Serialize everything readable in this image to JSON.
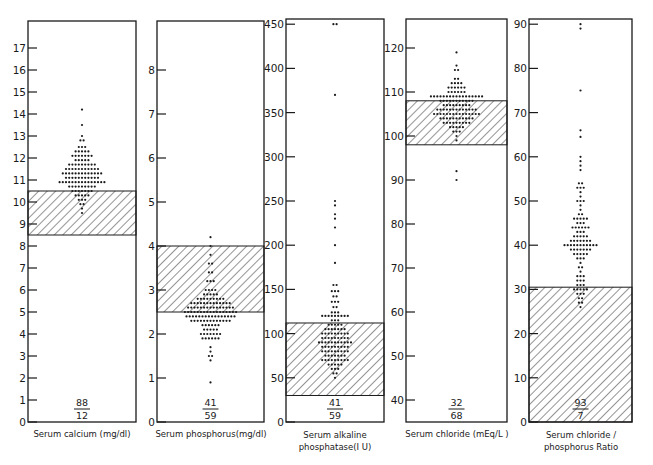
{
  "chart_data": [
    {
      "type": "scatter",
      "subtype": "dot-strip with shaded normal range",
      "title": "",
      "xlabel": "Serum calcium (mg/dl)",
      "ylabel": "",
      "ylim": [
        0,
        18
      ],
      "yticks": [
        0,
        1,
        2,
        3,
        4,
        5,
        6,
        7,
        8,
        9,
        10,
        11,
        12,
        13,
        14,
        15,
        16,
        17
      ],
      "normal_range": [
        8.5,
        10.5
      ],
      "fraction": {
        "numerator": "88",
        "denominator": "12"
      },
      "distribution": [
        {
          "y": 14.2,
          "n": 1
        },
        {
          "y": 13.5,
          "n": 1
        },
        {
          "y": 13.0,
          "n": 1
        },
        {
          "y": 12.8,
          "n": 2
        },
        {
          "y": 12.5,
          "n": 3
        },
        {
          "y": 12.3,
          "n": 5
        },
        {
          "y": 12.1,
          "n": 7
        },
        {
          "y": 11.9,
          "n": 5
        },
        {
          "y": 11.7,
          "n": 9
        },
        {
          "y": 11.5,
          "n": 11
        },
        {
          "y": 11.3,
          "n": 13
        },
        {
          "y": 11.1,
          "n": 11
        },
        {
          "y": 10.9,
          "n": 15
        },
        {
          "y": 10.7,
          "n": 9
        },
        {
          "y": 10.5,
          "n": 7
        },
        {
          "y": 10.3,
          "n": 5
        },
        {
          "y": 10.1,
          "n": 3
        },
        {
          "y": 9.9,
          "n": 2
        },
        {
          "y": 9.7,
          "n": 1
        },
        {
          "y": 9.5,
          "n": 1
        }
      ]
    },
    {
      "type": "scatter",
      "subtype": "dot-strip with shaded normal range",
      "title": "",
      "xlabel": "Serum phosphorus(mg/dl)",
      "ylabel": "",
      "ylim": [
        0,
        9
      ],
      "yticks": [
        0,
        1,
        2,
        3,
        4,
        5,
        6,
        7,
        8
      ],
      "normal_range": [
        2.5,
        4.0
      ],
      "fraction": {
        "numerator": "41",
        "denominator": "59"
      },
      "distribution": [
        {
          "y": 4.2,
          "n": 1
        },
        {
          "y": 4.0,
          "n": 1
        },
        {
          "y": 3.8,
          "n": 1
        },
        {
          "y": 3.6,
          "n": 2
        },
        {
          "y": 3.4,
          "n": 2
        },
        {
          "y": 3.2,
          "n": 3
        },
        {
          "y": 3.0,
          "n": 4
        },
        {
          "y": 2.9,
          "n": 5
        },
        {
          "y": 2.8,
          "n": 9
        },
        {
          "y": 2.7,
          "n": 13
        },
        {
          "y": 2.6,
          "n": 15
        },
        {
          "y": 2.5,
          "n": 17
        },
        {
          "y": 2.4,
          "n": 16
        },
        {
          "y": 2.3,
          "n": 13
        },
        {
          "y": 2.2,
          "n": 6
        },
        {
          "y": 2.1,
          "n": 5
        },
        {
          "y": 2.0,
          "n": 7
        },
        {
          "y": 1.9,
          "n": 6
        },
        {
          "y": 1.7,
          "n": 1
        },
        {
          "y": 1.6,
          "n": 1
        },
        {
          "y": 1.5,
          "n": 2
        },
        {
          "y": 1.4,
          "n": 1
        },
        {
          "y": 0.9,
          "n": 1
        }
      ]
    },
    {
      "type": "scatter",
      "subtype": "dot-strip with shaded normal range",
      "title": "",
      "xlabel": "Serum alkaline phosphatase(I U)",
      "ylabel": "",
      "ylim": [
        0,
        460
      ],
      "yticks": [
        0,
        50,
        100,
        150,
        200,
        250,
        300,
        350,
        400,
        450
      ],
      "normal_range": [
        30,
        112
      ],
      "fraction": {
        "numerator": "41",
        "denominator": "59"
      },
      "distribution": [
        {
          "y": 450,
          "n": 2
        },
        {
          "y": 370,
          "n": 1
        },
        {
          "y": 250,
          "n": 1
        },
        {
          "y": 245,
          "n": 1
        },
        {
          "y": 235,
          "n": 1
        },
        {
          "y": 230,
          "n": 1
        },
        {
          "y": 220,
          "n": 1
        },
        {
          "y": 200,
          "n": 1
        },
        {
          "y": 180,
          "n": 1
        },
        {
          "y": 155,
          "n": 2
        },
        {
          "y": 148,
          "n": 3
        },
        {
          "y": 142,
          "n": 2
        },
        {
          "y": 136,
          "n": 3
        },
        {
          "y": 130,
          "n": 2
        },
        {
          "y": 124,
          "n": 3
        },
        {
          "y": 120,
          "n": 9
        },
        {
          "y": 115,
          "n": 3
        },
        {
          "y": 110,
          "n": 5
        },
        {
          "y": 105,
          "n": 7
        },
        {
          "y": 100,
          "n": 9
        },
        {
          "y": 95,
          "n": 9
        },
        {
          "y": 90,
          "n": 11
        },
        {
          "y": 85,
          "n": 9
        },
        {
          "y": 80,
          "n": 9
        },
        {
          "y": 75,
          "n": 7
        },
        {
          "y": 70,
          "n": 9
        },
        {
          "y": 65,
          "n": 5
        },
        {
          "y": 60,
          "n": 3
        },
        {
          "y": 55,
          "n": 2
        },
        {
          "y": 50,
          "n": 1
        }
      ]
    },
    {
      "type": "scatter",
      "subtype": "dot-strip with shaded normal range",
      "title": "",
      "xlabel": "Serum chloride (mEq/L)",
      "ylabel": "",
      "ylim": [
        35,
        127
      ],
      "yticks": [
        40,
        50,
        60,
        70,
        80,
        90,
        100,
        110,
        120
      ],
      "normal_range": [
        98,
        108
      ],
      "fraction": {
        "numerator": "32",
        "denominator": "68"
      },
      "distribution": [
        {
          "y": 119,
          "n": 1
        },
        {
          "y": 116,
          "n": 1
        },
        {
          "y": 115,
          "n": 2
        },
        {
          "y": 113,
          "n": 2
        },
        {
          "y": 112,
          "n": 4
        },
        {
          "y": 111,
          "n": 6
        },
        {
          "y": 110,
          "n": 6
        },
        {
          "y": 109,
          "n": 17
        },
        {
          "y": 108,
          "n": 11
        },
        {
          "y": 107,
          "n": 9
        },
        {
          "y": 106,
          "n": 13
        },
        {
          "y": 105,
          "n": 15
        },
        {
          "y": 104,
          "n": 11
        },
        {
          "y": 103,
          "n": 9
        },
        {
          "y": 102,
          "n": 5
        },
        {
          "y": 101,
          "n": 3
        },
        {
          "y": 100,
          "n": 1
        },
        {
          "y": 99,
          "n": 1
        },
        {
          "y": 92,
          "n": 1
        },
        {
          "y": 90,
          "n": 1
        }
      ]
    },
    {
      "type": "scatter",
      "subtype": "dot-strip with shaded normal range",
      "title": "",
      "xlabel": "Serum chloride / phosphorus Ratio",
      "ylabel": "",
      "ylim": [
        0,
        91
      ],
      "yticks": [
        0,
        10,
        20,
        30,
        40,
        50,
        60,
        70,
        80,
        90
      ],
      "normal_range": [
        0,
        30.5
      ],
      "fraction": {
        "numerator": "93",
        "denominator": "7"
      },
      "distribution": [
        {
          "y": 90,
          "n": 1
        },
        {
          "y": 89,
          "n": 1
        },
        {
          "y": 75,
          "n": 1
        },
        {
          "y": 66,
          "n": 1
        },
        {
          "y": 64.5,
          "n": 1
        },
        {
          "y": 60,
          "n": 1
        },
        {
          "y": 59,
          "n": 1
        },
        {
          "y": 58,
          "n": 1
        },
        {
          "y": 57,
          "n": 1
        },
        {
          "y": 54,
          "n": 2
        },
        {
          "y": 53,
          "n": 3
        },
        {
          "y": 52,
          "n": 1
        },
        {
          "y": 51,
          "n": 1
        },
        {
          "y": 50,
          "n": 3
        },
        {
          "y": 49,
          "n": 1
        },
        {
          "y": 48,
          "n": 1
        },
        {
          "y": 47,
          "n": 2
        },
        {
          "y": 46,
          "n": 5
        },
        {
          "y": 45,
          "n": 3
        },
        {
          "y": 44,
          "n": 6
        },
        {
          "y": 43,
          "n": 3
        },
        {
          "y": 42,
          "n": 5
        },
        {
          "y": 41,
          "n": 7
        },
        {
          "y": 40,
          "n": 11
        },
        {
          "y": 39,
          "n": 7
        },
        {
          "y": 38,
          "n": 5
        },
        {
          "y": 37,
          "n": 3
        },
        {
          "y": 36,
          "n": 1
        },
        {
          "y": 35,
          "n": 2
        },
        {
          "y": 34,
          "n": 1
        },
        {
          "y": 33,
          "n": 3
        },
        {
          "y": 32,
          "n": 3
        },
        {
          "y": 31,
          "n": 3
        },
        {
          "y": 30,
          "n": 5
        },
        {
          "y": 29,
          "n": 3
        },
        {
          "y": 28,
          "n": 2
        },
        {
          "y": 27,
          "n": 2
        },
        {
          "y": 26,
          "n": 1
        }
      ]
    }
  ],
  "panels": [
    {
      "label": "Serum calcium (mg/dl)",
      "label_line2": "",
      "fraction_top": "88",
      "fraction_bottom": "12"
    },
    {
      "label": "Serum phosphorus(mg/dl)",
      "label_line2": "",
      "fraction_top": "41",
      "fraction_bottom": "59"
    },
    {
      "label": "Serum alkaline",
      "label_line2": "phosphatase(I U)",
      "fraction_top": "41",
      "fraction_bottom": "59"
    },
    {
      "label": "Serum chloride (mEq/L )",
      "label_line2": "",
      "fraction_top": "32",
      "fraction_bottom": "68"
    },
    {
      "label": "Serum chloride /",
      "label_line2": "phosphorus Ratio",
      "fraction_top": "93",
      "fraction_bottom": "7"
    }
  ],
  "colors": {
    "ink": "#1a1a1a",
    "background": "#ffffff",
    "hatch": "#2a2a2a"
  }
}
